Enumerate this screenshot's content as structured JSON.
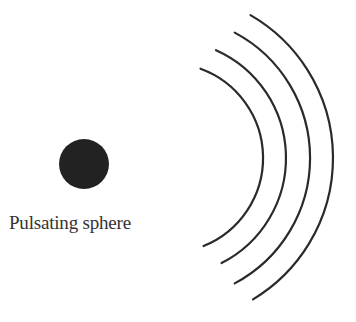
{
  "diagram": {
    "sphere": {
      "label": "Pulsating sphere",
      "color": "#222222",
      "cx": 84,
      "cy": 164,
      "r": 25
    },
    "waves": {
      "color": "#2a2a2a",
      "center": [
        168,
        158
      ],
      "arcs": [
        {
          "r": 95,
          "start_deg": -70,
          "end_deg": 68
        },
        {
          "r": 118,
          "start_deg": -66,
          "end_deg": 63
        },
        {
          "r": 142,
          "start_deg": -62,
          "end_deg": 62
        },
        {
          "r": 165,
          "start_deg": -60,
          "end_deg": 59
        }
      ]
    },
    "bottom_caption": {
      "label": ""
    }
  }
}
